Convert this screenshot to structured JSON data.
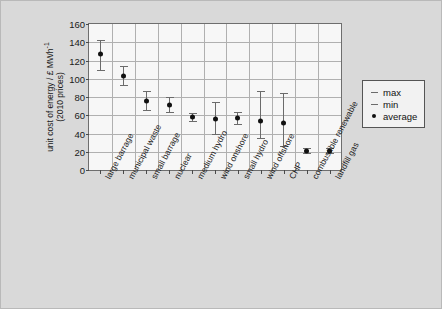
{
  "chart_data": {
    "type": "scatter",
    "title": "",
    "xlabel": "",
    "ylabel": "unit cost of energy / £ MWh⁻¹ (2010 prices)",
    "ylabel_line1": "unit cost of energy / £ MWh",
    "ylabel_sup": "-1",
    "ylabel_line2": "(2010 prices)",
    "ylim": [
      0,
      160
    ],
    "yticks": [
      0,
      20,
      40,
      60,
      80,
      100,
      120,
      140,
      160
    ],
    "grid": true,
    "legend_position": "right",
    "categories": [
      "large barrage",
      "municipal waste",
      "small barrage",
      "nuclear",
      "medium hydro",
      "wind onshore",
      "small hydro",
      "wind offshore",
      "CHP",
      "combustible renewable",
      "landfill gas"
    ],
    "series": [
      {
        "name": "average",
        "values": [
          127,
          103,
          76,
          71,
          58,
          56,
          57,
          54,
          51,
          21,
          21
        ]
      },
      {
        "name": "max",
        "values": [
          143,
          114,
          87,
          80,
          62,
          75,
          64,
          87,
          84,
          24,
          24
        ]
      },
      {
        "name": "min",
        "values": [
          110,
          93,
          66,
          64,
          54,
          39,
          50,
          35,
          26,
          19,
          19
        ]
      }
    ],
    "legend": [
      {
        "label": "max",
        "key": "dash-icon"
      },
      {
        "label": "min",
        "key": "dash-icon"
      },
      {
        "label": "average",
        "key": "dot-icon"
      }
    ]
  },
  "colors": {
    "figure_background": "#d9d9d9",
    "plot_background": "#f7f7f7",
    "gridline": "#b0b0b0",
    "axis": "#6e6e6e",
    "marker": "#111111",
    "errorbar": "#6b6b6b",
    "legend_background": "#f2f2f2"
  }
}
